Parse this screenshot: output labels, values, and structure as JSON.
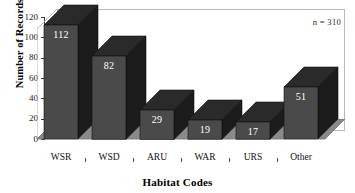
{
  "chart_data": {
    "type": "bar",
    "title": "",
    "xlabel": "Habitat Codes",
    "ylabel": "Number of Records",
    "categories": [
      "WSR",
      "WSD",
      "ARU",
      "WAR",
      "URS",
      "Other"
    ],
    "values": [
      112,
      82,
      29,
      19,
      17,
      51
    ],
    "value_labels": [
      "112",
      "82",
      "29",
      "19",
      "17",
      "51"
    ],
    "ylim": [
      0,
      120
    ],
    "yticks": [
      0,
      20,
      40,
      60,
      80,
      100,
      120
    ],
    "ytick_labels": [
      "0",
      "20",
      "40",
      "60",
      "80",
      "100",
      "120"
    ],
    "grid": false,
    "legend": false,
    "annotation": "n = 310",
    "style": "3d-column",
    "colors": {
      "bar_front": "#4a4a4a",
      "bar_side": "#1c1c1c",
      "bar_top": "#2a2a2a",
      "floor": "#8a8a8a",
      "floor_edge": "#6f6f6f",
      "back_wall": "#ffffff",
      "frame": "#b9b9b9",
      "value_label": "#ffffff",
      "text": "#000000"
    }
  },
  "axes": {
    "y_title": "Number of Records",
    "x_title": "Habitat Codes"
  },
  "annotations": {
    "sample_size": "n = 310"
  }
}
